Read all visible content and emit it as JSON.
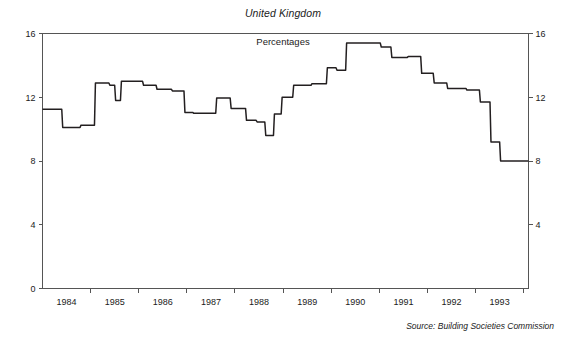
{
  "chart_data": {
    "type": "line",
    "title": "United Kingdom",
    "subtitle": "Percentages",
    "source": "Source: Building Societies Commission",
    "xlabel": "",
    "ylabel": "",
    "ylim": [
      0,
      16
    ],
    "yticks": [
      0,
      4,
      8,
      12,
      16
    ],
    "ytick_labels_left": [
      "0",
      "4",
      "8",
      "12",
      "16"
    ],
    "ytick_labels_right": [
      "4",
      "8",
      "12",
      "16"
    ],
    "xlim": [
      1983.5,
      1993.6
    ],
    "xtick_labels": [
      "1984",
      "1985",
      "1986",
      "1987",
      "1988",
      "1989",
      "1990",
      "1991",
      "1992",
      "1993"
    ],
    "grid": false,
    "legend": "none",
    "line_style": "step",
    "series": [
      {
        "name": "Mortgage interest rate",
        "x": [
          1983.5,
          1983.9,
          1983.92,
          1984.28,
          1984.3,
          1984.58,
          1984.6,
          1984.88,
          1984.9,
          1985.0,
          1985.02,
          1985.12,
          1985.14,
          1985.58,
          1985.6,
          1985.86,
          1985.88,
          1986.18,
          1986.2,
          1986.44,
          1986.46,
          1986.62,
          1986.64,
          1987.1,
          1987.12,
          1987.4,
          1987.42,
          1987.72,
          1987.74,
          1987.94,
          1987.96,
          1988.12,
          1988.14,
          1988.3,
          1988.32,
          1988.46,
          1988.48,
          1988.7,
          1988.72,
          1989.08,
          1989.1,
          1989.4,
          1989.42,
          1989.6,
          1989.62,
          1989.8,
          1989.82,
          1990.52,
          1990.54,
          1990.74,
          1990.76,
          1991.08,
          1991.1,
          1991.36,
          1991.38,
          1991.62,
          1991.64,
          1991.9,
          1991.92,
          1992.3,
          1992.32,
          1992.58,
          1992.6,
          1992.8,
          1992.82,
          1993.0,
          1993.02,
          1993.6
        ],
        "y": [
          11.25,
          11.25,
          10.1,
          10.1,
          10.25,
          10.25,
          12.9,
          12.9,
          12.75,
          12.75,
          11.8,
          11.8,
          13.0,
          13.0,
          12.75,
          12.75,
          12.5,
          12.5,
          12.4,
          12.4,
          11.05,
          11.05,
          11.0,
          11.0,
          11.95,
          11.95,
          11.3,
          11.3,
          10.55,
          10.55,
          10.45,
          10.45,
          9.6,
          9.6,
          10.95,
          10.95,
          12.0,
          12.0,
          12.75,
          12.75,
          12.85,
          12.85,
          13.85,
          13.85,
          13.7,
          13.7,
          15.4,
          15.4,
          15.15,
          15.15,
          14.5,
          14.5,
          14.55,
          14.55,
          13.5,
          13.5,
          12.9,
          12.9,
          12.55,
          12.55,
          12.45,
          12.45,
          11.7,
          11.7,
          9.2,
          9.2,
          8.0,
          8.0
        ]
      }
    ]
  },
  "axes": {
    "y_left_label_0": "0",
    "y_left_label_4": "4",
    "y_left_label_8": "8",
    "y_left_label_12": "12",
    "y_left_label_16": "16",
    "y_right_label_4": "4",
    "y_right_label_8": "8",
    "y_right_label_12": "12",
    "y_right_label_16": "16"
  }
}
